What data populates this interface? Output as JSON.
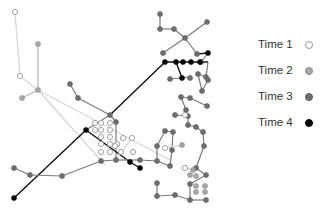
{
  "chart_data": {
    "type": "network",
    "title": "",
    "legend": [
      {
        "label": "Time 1",
        "fill": "#ffffff",
        "stroke": "#9a9a9a",
        "edge": "#d8d8d8"
      },
      {
        "label": "Time 2",
        "fill": "#a8a8a8",
        "stroke": "#8a8a8a",
        "edge": "#b4b4b4"
      },
      {
        "label": "Time 3",
        "fill": "#6e6e6e",
        "stroke": "#5a5a5a",
        "edge": "#7a7a7a"
      },
      {
        "label": "Time 4",
        "fill": "#000000",
        "stroke": "#000000",
        "edge": "#111111"
      }
    ],
    "legend_position": "right",
    "edges": [
      [
        15,
        12,
        20,
        76,
        0
      ],
      [
        38,
        44,
        38,
        90,
        1
      ],
      [
        20,
        76,
        38,
        90,
        0
      ],
      [
        22,
        98,
        38,
        90,
        1
      ],
      [
        38,
        90,
        105,
        165,
        0
      ],
      [
        38,
        90,
        170,
        160,
        0
      ],
      [
        70,
        84,
        78,
        98,
        2
      ],
      [
        78,
        98,
        110,
        115,
        2
      ],
      [
        110,
        115,
        165,
        62,
        3
      ],
      [
        86,
        130,
        110,
        115,
        2
      ],
      [
        110,
        115,
        116,
        122,
        2
      ],
      [
        116,
        122,
        116,
        160,
        2
      ],
      [
        14,
        198,
        86,
        130,
        3
      ],
      [
        86,
        130,
        130,
        162,
        3
      ],
      [
        130,
        162,
        140,
        168,
        3
      ],
      [
        14,
        168,
        30,
        175,
        2
      ],
      [
        30,
        175,
        62,
        176,
        2
      ],
      [
        62,
        176,
        101,
        161,
        2
      ],
      [
        101,
        161,
        116,
        160,
        2
      ],
      [
        116,
        160,
        140,
        160,
        2
      ],
      [
        140,
        160,
        157,
        161,
        2
      ],
      [
        157,
        161,
        157,
        146,
        2
      ],
      [
        157,
        146,
        165,
        131,
        2
      ],
      [
        165,
        131,
        173,
        132,
        2
      ],
      [
        173,
        132,
        172,
        150,
        2
      ],
      [
        172,
        150,
        170,
        166,
        2
      ],
      [
        170,
        166,
        157,
        161,
        2
      ],
      [
        160,
        14,
        160,
        29,
        2
      ],
      [
        160,
        29,
        174,
        29,
        2
      ],
      [
        174,
        29,
        185,
        38,
        2
      ],
      [
        185,
        38,
        207,
        22,
        2
      ],
      [
        185,
        38,
        163,
        53,
        2
      ],
      [
        185,
        38,
        197,
        54,
        2
      ],
      [
        197,
        54,
        208,
        53,
        3
      ],
      [
        208,
        53,
        201,
        62,
        2
      ],
      [
        165,
        62,
        208,
        62,
        3
      ],
      [
        176,
        62,
        182,
        78,
        3
      ],
      [
        182,
        78,
        170,
        79,
        2
      ],
      [
        182,
        78,
        183,
        77,
        2
      ],
      [
        183,
        77,
        190,
        78,
        2
      ],
      [
        208,
        62,
        206,
        77,
        2
      ],
      [
        206,
        77,
        198,
        74,
        2
      ],
      [
        198,
        74,
        202,
        91,
        2
      ],
      [
        202,
        91,
        208,
        80,
        2
      ],
      [
        207,
        106,
        190,
        98,
        2
      ],
      [
        190,
        98,
        181,
        97,
        2
      ],
      [
        181,
        97,
        186,
        110,
        2
      ],
      [
        186,
        110,
        188,
        116,
        2
      ],
      [
        188,
        116,
        175,
        115,
        2
      ],
      [
        188,
        116,
        188,
        125,
        2
      ],
      [
        188,
        125,
        196,
        127,
        2
      ],
      [
        196,
        127,
        203,
        132,
        2
      ],
      [
        203,
        132,
        204,
        146,
        2
      ],
      [
        204,
        146,
        196,
        168,
        2
      ],
      [
        196,
        168,
        206,
        175,
        2
      ],
      [
        206,
        175,
        190,
        184,
        2
      ],
      [
        190,
        184,
        190,
        200,
        2
      ],
      [
        190,
        200,
        175,
        195,
        2
      ],
      [
        175,
        195,
        157,
        196,
        2
      ],
      [
        157,
        196,
        157,
        183,
        2
      ],
      [
        190,
        200,
        206,
        200,
        2
      ],
      [
        165,
        148,
        182,
        145,
        0
      ],
      [
        132,
        138,
        116,
        160,
        0
      ],
      [
        185,
        168,
        193,
        170,
        0
      ]
    ],
    "nodes": [
      [
        15,
        12,
        0
      ],
      [
        20,
        76,
        0
      ],
      [
        38,
        44,
        1
      ],
      [
        38,
        90,
        1
      ],
      [
        22,
        98,
        1
      ],
      [
        70,
        84,
        2
      ],
      [
        78,
        98,
        2
      ],
      [
        110,
        115,
        2
      ],
      [
        86,
        130,
        3
      ],
      [
        116,
        122,
        2
      ],
      [
        14,
        198,
        3
      ],
      [
        14,
        168,
        2
      ],
      [
        30,
        175,
        2
      ],
      [
        62,
        176,
        2
      ],
      [
        101,
        161,
        2
      ],
      [
        116,
        160,
        2
      ],
      [
        140,
        160,
        2
      ],
      [
        157,
        161,
        2
      ],
      [
        157,
        146,
        2
      ],
      [
        165,
        131,
        2
      ],
      [
        173,
        132,
        2
      ],
      [
        172,
        150,
        2
      ],
      [
        170,
        166,
        2
      ],
      [
        130,
        162,
        3
      ],
      [
        140,
        168,
        3
      ],
      [
        95,
        123,
        0
      ],
      [
        101,
        123,
        0
      ],
      [
        110,
        123,
        0
      ],
      [
        95,
        130,
        0
      ],
      [
        101,
        130,
        0
      ],
      [
        110,
        130,
        0
      ],
      [
        101,
        137,
        0
      ],
      [
        110,
        137,
        0
      ],
      [
        101,
        144,
        0
      ],
      [
        110,
        144,
        0
      ],
      [
        117,
        144,
        0
      ],
      [
        101,
        152,
        0
      ],
      [
        110,
        152,
        0
      ],
      [
        121,
        152,
        0
      ],
      [
        133,
        152,
        0
      ],
      [
        132,
        138,
        0
      ],
      [
        115,
        146,
        0
      ],
      [
        123,
        138,
        0
      ],
      [
        160,
        14,
        2
      ],
      [
        160,
        29,
        2
      ],
      [
        174,
        29,
        2
      ],
      [
        185,
        38,
        2
      ],
      [
        207,
        22,
        2
      ],
      [
        163,
        53,
        2
      ],
      [
        197,
        54,
        2
      ],
      [
        208,
        53,
        3
      ],
      [
        201,
        62,
        2
      ],
      [
        165,
        62,
        3
      ],
      [
        176,
        62,
        3
      ],
      [
        183,
        62,
        3
      ],
      [
        191,
        62,
        3
      ],
      [
        200,
        62,
        3
      ],
      [
        182,
        78,
        3
      ],
      [
        170,
        79,
        2
      ],
      [
        190,
        78,
        2
      ],
      [
        206,
        77,
        2
      ],
      [
        198,
        74,
        2
      ],
      [
        202,
        91,
        2
      ],
      [
        208,
        80,
        2
      ],
      [
        207,
        106,
        2
      ],
      [
        190,
        98,
        2
      ],
      [
        181,
        97,
        2
      ],
      [
        186,
        110,
        2
      ],
      [
        175,
        115,
        2
      ],
      [
        188,
        116,
        2
      ],
      [
        188,
        125,
        2
      ],
      [
        185,
        115,
        0
      ],
      [
        196,
        127,
        2
      ],
      [
        203,
        132,
        2
      ],
      [
        204,
        146,
        2
      ],
      [
        196,
        168,
        2
      ],
      [
        206,
        175,
        2
      ],
      [
        190,
        184,
        2
      ],
      [
        190,
        200,
        2
      ],
      [
        175,
        195,
        2
      ],
      [
        157,
        196,
        2
      ],
      [
        157,
        183,
        2
      ],
      [
        206,
        200,
        2
      ],
      [
        165,
        148,
        0
      ],
      [
        182,
        145,
        1
      ],
      [
        185,
        168,
        0
      ],
      [
        193,
        170,
        1
      ],
      [
        196,
        176,
        1
      ],
      [
        196,
        186,
        1
      ],
      [
        205,
        186,
        1
      ],
      [
        196,
        192,
        1
      ],
      [
        205,
        192,
        1
      ],
      [
        190,
        175,
        1
      ]
    ]
  },
  "legend": {
    "items": [
      {
        "label": "Time 1"
      },
      {
        "label": "Time 2"
      },
      {
        "label": "Time 3"
      },
      {
        "label": "Time 4"
      }
    ]
  }
}
